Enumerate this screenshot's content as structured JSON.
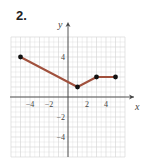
{
  "problem": {
    "number": "2."
  },
  "chart_data": {
    "type": "line",
    "title": "",
    "xlabel": "x",
    "ylabel": "y",
    "xlim": [
      -6,
      6
    ],
    "ylim": [
      -6,
      6
    ],
    "grid": true,
    "x_tick_labels": [
      "−4",
      "−2",
      "2",
      "4"
    ],
    "x_tick_values": [
      -4,
      -2,
      2,
      4
    ],
    "y_tick_labels": [
      "4",
      "−2",
      "−4"
    ],
    "y_tick_values": [
      4,
      -2,
      -4
    ],
    "series": [
      {
        "name": "piecewise",
        "color": "#a0503c",
        "points": [
          [
            -5,
            4
          ],
          [
            1,
            1
          ],
          [
            3,
            2
          ],
          [
            5,
            2
          ]
        ]
      }
    ]
  },
  "colors": {
    "grid": "#d9d9d9",
    "axis": "#444444",
    "line": "#a0503c",
    "point": "#111111",
    "text": "#444444"
  }
}
